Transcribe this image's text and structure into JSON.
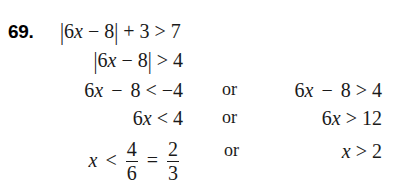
{
  "problem": {
    "number": "69.",
    "topic": "absolute-value-inequality-solution"
  },
  "lines": [
    {
      "id": "line-1",
      "role": "original-inequality",
      "expression": "|6x − 8| + 3 > 7",
      "parts": {
        "abs_open": "|",
        "coef": "6",
        "var": "x",
        "minus": "−",
        "const": "8",
        "abs_close": "|",
        "plus": "+",
        "added": "3",
        "rel": ">",
        "rhs": "7"
      }
    },
    {
      "id": "line-2",
      "role": "isolated-absolute-value",
      "expression": "|6x − 8| > 4",
      "parts": {
        "abs_open": "|",
        "coef": "6",
        "var": "x",
        "minus": "−",
        "const": "8",
        "abs_close": "|",
        "rel": ">",
        "rhs": "4"
      }
    },
    {
      "id": "line-3",
      "role": "compound-split",
      "left": {
        "expression": "6x − 8 < −4",
        "coef": "6",
        "var": "x",
        "minus": "−",
        "const": "8",
        "rel": "<",
        "rhs": "−4"
      },
      "connector": "or",
      "right": {
        "expression": "6x − 8 > 4",
        "coef": "6",
        "var": "x",
        "minus": "−",
        "const": "8",
        "rel": ">",
        "rhs": "4"
      }
    },
    {
      "id": "line-4",
      "role": "add-eight-both-sides",
      "left": {
        "expression": "6x < 4",
        "coef": "6",
        "var": "x",
        "rel": "<",
        "rhs": "4"
      },
      "connector": "or",
      "right": {
        "expression": "6x > 12",
        "coef": "6",
        "var": "x",
        "rel": ">",
        "rhs": "12"
      }
    },
    {
      "id": "line-5",
      "role": "final-solution",
      "left": {
        "expression": "x < 4/6 = 2/3",
        "var": "x",
        "rel": "<",
        "fraction_1": {
          "numerator": "4",
          "denominator": "6"
        },
        "equals": "=",
        "fraction_2": {
          "numerator": "2",
          "denominator": "3"
        }
      },
      "connector": "or",
      "right": {
        "expression": "x > 2",
        "var": "x",
        "rel": ">",
        "rhs": "2"
      }
    }
  ],
  "colors": {
    "background": "#ffffff",
    "text": "#1a1a1a",
    "number": "#000000"
  }
}
